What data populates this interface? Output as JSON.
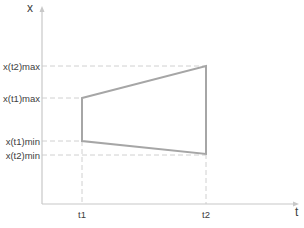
{
  "diagram": {
    "axes": {
      "y_label": "x",
      "x_label": "t"
    },
    "ticks": {
      "t1": "t1",
      "t2": "t2"
    },
    "levels": {
      "x_t2_max": "x(t2)max",
      "x_t1_max": "x(t1)max",
      "x_t1_min": "x(t1)min",
      "x_t2_min": "x(t2)min"
    },
    "colors": {
      "axis": "#c8c8c8",
      "shape": "#a6a6a6",
      "guide": "#d0d0d0",
      "text": "#404040"
    }
  }
}
